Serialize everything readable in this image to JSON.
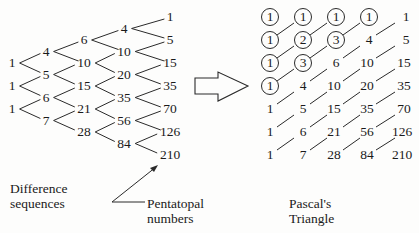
{
  "difference_tree": {
    "columns": [
      [
        "1",
        "1",
        "1"
      ],
      [
        "4",
        "5",
        "6",
        "7"
      ],
      [
        "6",
        "10",
        "15",
        "21",
        "28"
      ],
      [
        "4",
        "10",
        "20",
        "35",
        "56",
        "84"
      ],
      [
        "1",
        "5",
        "15",
        "35",
        "70",
        "126",
        "210"
      ]
    ]
  },
  "pascal_triangle": {
    "rows": [
      [
        "1",
        "1",
        "1",
        "1",
        "1"
      ],
      [
        "1",
        "2",
        "3",
        "4",
        "5"
      ],
      [
        "1",
        "3",
        "6",
        "10",
        "15"
      ],
      [
        "1",
        "4",
        "10",
        "20",
        "35"
      ],
      [
        "1",
        "5",
        "15",
        "35",
        "70"
      ],
      [
        "1",
        "6",
        "21",
        "56",
        "126"
      ],
      [
        "1",
        "7",
        "28",
        "84",
        "210"
      ]
    ],
    "circled": [
      [
        0,
        0
      ],
      [
        0,
        1
      ],
      [
        0,
        2
      ],
      [
        0,
        3
      ],
      [
        1,
        0
      ],
      [
        1,
        1
      ],
      [
        1,
        2
      ],
      [
        2,
        0
      ],
      [
        2,
        1
      ],
      [
        3,
        0
      ]
    ]
  },
  "labels": {
    "difference_line1": "Difference",
    "difference_line2": "sequences",
    "pentatopal_line1": "Pentatopal",
    "pentatopal_line2": "numbers",
    "pascal_line1": "Pascal's",
    "pascal_line2": "Triangle"
  },
  "arrow": {
    "icon": "right-arrow-icon"
  }
}
